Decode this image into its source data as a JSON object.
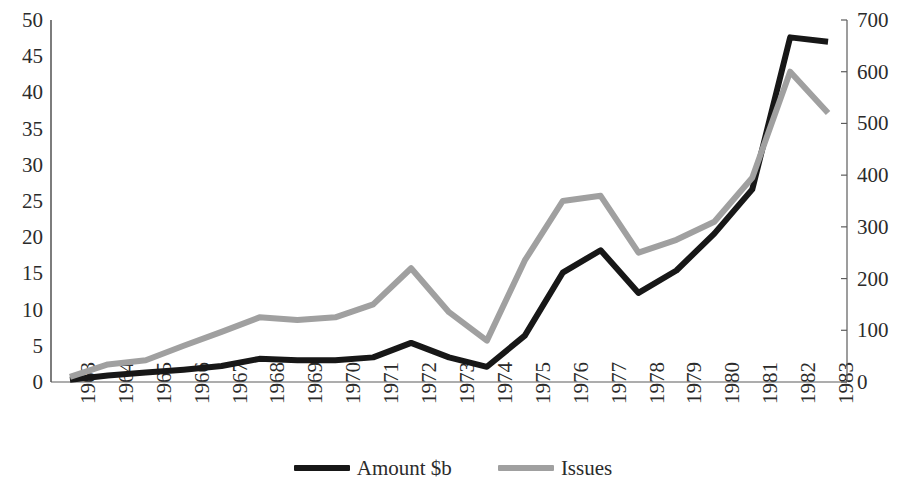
{
  "chart_data": {
    "type": "line",
    "title": "",
    "xlabel": "",
    "ylabel": "",
    "grid": false,
    "legend_position": "bottom",
    "categories": [
      "1963",
      "1964",
      "1965",
      "1966",
      "1967",
      "1968",
      "1969",
      "1970",
      "1971",
      "1972",
      "1973",
      "1974",
      "1975",
      "1976",
      "1977",
      "1978",
      "1979",
      "1980",
      "1981",
      "1982",
      "1983"
    ],
    "axes": {
      "left": {
        "label": "Amount $b",
        "min": 0,
        "max": 50,
        "step": 5,
        "ticks": [
          "0",
          "5",
          "10",
          "15",
          "20",
          "25",
          "30",
          "35",
          "40",
          "45",
          "50"
        ]
      },
      "right": {
        "label": "Issues",
        "min": 0,
        "max": 700,
        "step": 100,
        "ticks": [
          "0",
          "100",
          "200",
          "300",
          "400",
          "500",
          "600",
          "700"
        ]
      }
    },
    "series": [
      {
        "name": "Amount $b",
        "axis": "left",
        "color": "#171717",
        "values": [
          0.3,
          0.9,
          1.3,
          1.7,
          2.2,
          3.2,
          3.0,
          3.0,
          3.4,
          5.4,
          3.4,
          2.1,
          6.4,
          15.1,
          18.2,
          12.3,
          15.4,
          20.5,
          26.6,
          47.6,
          47.0
        ]
      },
      {
        "name": "Issues",
        "axis": "right",
        "color": "#a0a0a0",
        "values": [
          10,
          34,
          42,
          70,
          97,
          125,
          120,
          125,
          150,
          220,
          135,
          80,
          235,
          350,
          360,
          250,
          275,
          310,
          395,
          600,
          520
        ]
      }
    ],
    "legend": [
      {
        "label": "Amount $b",
        "color": "#171717"
      },
      {
        "label": "Issues",
        "color": "#a0a0a0"
      }
    ],
    "geometry": {
      "plot_left": 51,
      "plot_right": 847,
      "plot_top": 20,
      "plot_bottom": 382,
      "axis_color": "#5c5c5c",
      "x_label_top": 404,
      "series_line_width_black": 6,
      "series_line_width_gray": 6
    }
  }
}
